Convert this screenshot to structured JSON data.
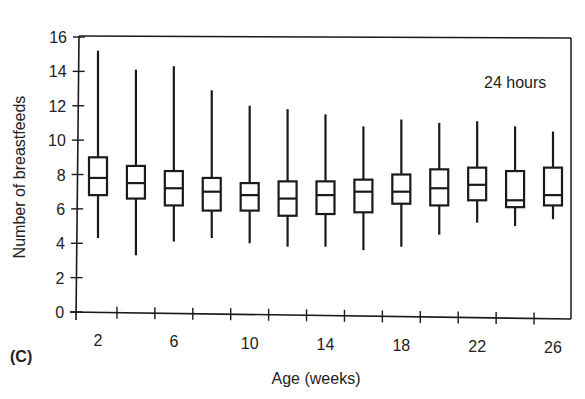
{
  "panel_label": "(C)",
  "chart_data": {
    "type": "boxplot",
    "title": "",
    "annotation": "24 hours",
    "xlabel": "Age (weeks)",
    "ylabel": "Number of breastfeeds",
    "ylim": [
      0,
      16
    ],
    "yticks": [
      0,
      2,
      4,
      6,
      8,
      10,
      12,
      14,
      16
    ],
    "xtick_labels": [
      "2",
      "6",
      "10",
      "14",
      "18",
      "22",
      "26"
    ],
    "categories": [
      2,
      4,
      6,
      8,
      10,
      12,
      14,
      16,
      18,
      20,
      22,
      24,
      26
    ],
    "boxes": [
      {
        "x": 2,
        "whisker_high": 15.2,
        "q3": 9.0,
        "median": 7.8,
        "q1": 6.8,
        "whisker_low": 4.3
      },
      {
        "x": 4,
        "whisker_high": 14.1,
        "q3": 8.5,
        "median": 7.5,
        "q1": 6.6,
        "whisker_low": 3.3
      },
      {
        "x": 6,
        "whisker_high": 14.3,
        "q3": 8.2,
        "median": 7.2,
        "q1": 6.2,
        "whisker_low": 4.1
      },
      {
        "x": 8,
        "whisker_high": 12.9,
        "q3": 7.8,
        "median": 7.0,
        "q1": 5.9,
        "whisker_low": 4.3
      },
      {
        "x": 10,
        "whisker_high": 12.0,
        "q3": 7.5,
        "median": 6.8,
        "q1": 5.9,
        "whisker_low": 4.0
      },
      {
        "x": 12,
        "whisker_high": 11.8,
        "q3": 7.6,
        "median": 6.6,
        "q1": 5.6,
        "whisker_low": 3.8
      },
      {
        "x": 14,
        "whisker_high": 11.5,
        "q3": 7.6,
        "median": 6.8,
        "q1": 5.7,
        "whisker_low": 3.8
      },
      {
        "x": 16,
        "whisker_high": 10.8,
        "q3": 7.7,
        "median": 7.0,
        "q1": 5.8,
        "whisker_low": 3.6
      },
      {
        "x": 18,
        "whisker_high": 11.2,
        "q3": 8.0,
        "median": 7.0,
        "q1": 6.3,
        "whisker_low": 3.8
      },
      {
        "x": 20,
        "whisker_high": 11.0,
        "q3": 8.3,
        "median": 7.2,
        "q1": 6.2,
        "whisker_low": 4.5
      },
      {
        "x": 22,
        "whisker_high": 11.1,
        "q3": 8.4,
        "median": 7.4,
        "q1": 6.5,
        "whisker_low": 5.2
      },
      {
        "x": 24,
        "whisker_high": 10.8,
        "q3": 8.2,
        "median": 6.5,
        "q1": 6.1,
        "whisker_low": 5.0
      },
      {
        "x": 26,
        "whisker_high": 10.5,
        "q3": 8.4,
        "median": 6.8,
        "q1": 6.2,
        "whisker_low": 5.4
      }
    ],
    "grid": false,
    "legend": null
  }
}
